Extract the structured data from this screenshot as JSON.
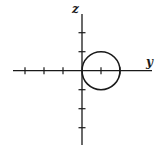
{
  "diagram": {
    "type": "coordinate-plane",
    "axes": {
      "horizontal": {
        "label": "y",
        "ticks_negative": 3,
        "ticks_positive": 2
      },
      "vertical": {
        "label": "z",
        "ticks_positive": 2,
        "ticks_negative": 3
      }
    },
    "circle": {
      "center": [
        1,
        0
      ],
      "radius": 1,
      "description": "circle tangent to z-axis at origin, centered at y=1"
    },
    "stroke_color": "#1a1a1a"
  }
}
